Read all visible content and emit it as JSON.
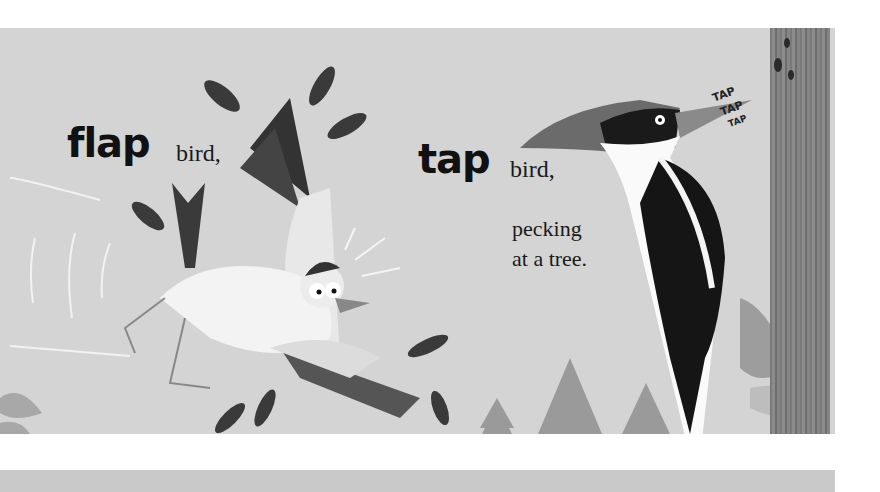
{
  "spread": {
    "left_page": {
      "big_word": "flap",
      "small_word": "bird,"
    },
    "right_page": {
      "big_word": "tap",
      "small_word": "bird,",
      "line2": "pecking",
      "line3": "at a tree.",
      "sound_effect": [
        "TAP",
        "TAP",
        "TAP"
      ]
    }
  },
  "colors": {
    "background": "#d4d4d4",
    "ink": "#111111",
    "trunk": "#7f7f7f",
    "tree_silhouette": "#9a9a9a",
    "feather": "#3a3a3a",
    "white_bird": "#efefef"
  },
  "illustrations": [
    "flapping-white-bird",
    "falling-feathers",
    "woodpecker",
    "tree-trunk",
    "pine-trees",
    "leaves"
  ]
}
